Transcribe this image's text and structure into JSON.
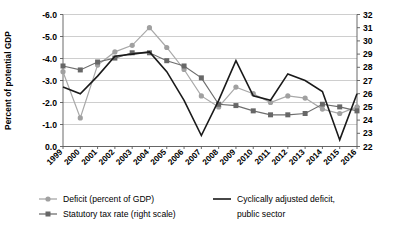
{
  "chart_data": {
    "type": "line",
    "title": "",
    "xlabel": "",
    "ylabel": "Percent of potential GDP",
    "ylabel_right": "",
    "grid": true,
    "legend_position": "bottom",
    "x": [
      "1999",
      "2000",
      "2001",
      "2002",
      "2003",
      "2004",
      "2005",
      "2006",
      "2007",
      "2008",
      "2009",
      "2010",
      "2011",
      "2012",
      "2013",
      "2014",
      "2015",
      "2016"
    ],
    "yaxis_left": {
      "inverted": true,
      "ticks": [
        "-6.0",
        "-5.0",
        "-4.0",
        "-3.0",
        "-2.0",
        "-1.0",
        "0.0"
      ],
      "tick_values": [
        -6.0,
        -5.0,
        -4.0,
        -3.0,
        -2.0,
        -1.0,
        0.0
      ],
      "ylim": [
        0.0,
        -6.0
      ]
    },
    "yaxis_right": {
      "ticks": [
        "32",
        "31",
        "30",
        "29",
        "28",
        "27",
        "26",
        "25",
        "24",
        "23",
        "22"
      ],
      "tick_values": [
        32,
        31,
        30,
        29,
        28,
        27,
        26,
        25,
        24,
        23,
        22
      ],
      "ylim": [
        22,
        32
      ]
    },
    "series": [
      {
        "name": "Deficit (percent of GDP)",
        "axis": "left",
        "color": "#a0a0a0",
        "marker": "circle",
        "values": [
          -3.4,
          -1.3,
          -3.7,
          -4.3,
          -4.6,
          -5.4,
          -4.5,
          -3.5,
          -2.3,
          -1.8,
          -2.7,
          -2.4,
          -2.0,
          -2.3,
          -2.2,
          -1.7,
          -1.5,
          -1.8
        ]
      },
      {
        "name": "Statutory tax rate (right scale)",
        "axis": "right",
        "color": "#676767",
        "marker": "square",
        "values": [
          28.1,
          27.8,
          28.4,
          28.7,
          29.1,
          29.1,
          28.5,
          28.1,
          27.2,
          25.2,
          25.1,
          24.7,
          24.4,
          24.4,
          24.5,
          25.2,
          25.0,
          24.7
        ]
      },
      {
        "name": "Cyclically adjusted deficit, public sector",
        "axis": "left",
        "color": "#1a1a1a",
        "marker": "none",
        "values": [
          -2.7,
          -2.4,
          -3.2,
          -4.1,
          -4.2,
          -4.3,
          -3.4,
          -2.1,
          -0.5,
          -2.1,
          -3.9,
          -2.3,
          -2.1,
          -3.3,
          -3.0,
          -2.5,
          -0.3,
          -2.4
        ]
      }
    ],
    "legend": [
      {
        "label": "Deficit (percent of GDP)",
        "marker": "circle",
        "color": "#a0a0a0"
      },
      {
        "label": "Statutory tax rate (right scale)",
        "marker": "square",
        "color": "#676767"
      },
      {
        "label": "Cyclically adjusted deficit,",
        "label2": "public sector",
        "marker": "line",
        "color": "#1a1a1a"
      }
    ]
  },
  "axis": {
    "ylabel": "Percent of potential GDP",
    "left_ticks": [
      "-6.0",
      "-5.0",
      "-4.0",
      "-3.0",
      "-2.0",
      "-1.0",
      "0.0"
    ],
    "right_ticks": [
      "32",
      "31",
      "30",
      "29",
      "28",
      "27",
      "26",
      "25",
      "24",
      "23",
      "22"
    ],
    "x_ticks": [
      "1999",
      "2000",
      "2001",
      "2002",
      "2003",
      "2004",
      "2005",
      "2006",
      "2007",
      "2008",
      "2009",
      "2010",
      "2011",
      "2012",
      "2013",
      "2014",
      "2015",
      "2016"
    ]
  },
  "legend": {
    "item1": "Deficit (percent of GDP)",
    "item2": "Statutory tax rate (right scale)",
    "item3_line1": "Cyclically adjusted deficit,",
    "item3_line2": "public sector"
  }
}
